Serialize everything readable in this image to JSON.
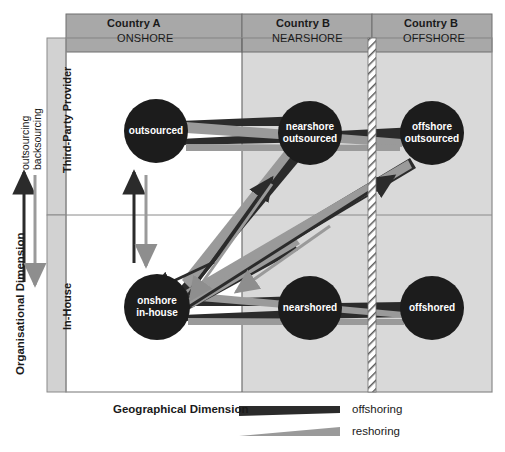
{
  "figure": {
    "type": "diagram"
  },
  "columns": [
    {
      "id": "onshore",
      "country": "Country A",
      "shore": "ONSHORE",
      "shaded": false
    },
    {
      "id": "nearshore",
      "country": "Country B",
      "shore": "NEARSHORE",
      "shaded": true
    },
    {
      "id": "offshore",
      "country": "Country B",
      "shore": "OFFSHORE",
      "shaded": true
    }
  ],
  "rows": [
    {
      "id": "third-party",
      "label": "Third-Party Provider"
    },
    {
      "id": "in-house",
      "label": "In-House"
    }
  ],
  "axes": {
    "vertical": {
      "label": "Organisational Dimension",
      "up_arrow_label": "outsourcing",
      "down_arrow_label": "backsourcing"
    },
    "horizontal": {
      "label": "Geographical Dimension"
    }
  },
  "nodes": [
    {
      "id": "outsourced",
      "label": "outsourced",
      "row": "third-party",
      "col": "onshore",
      "cx": 156,
      "cy": 131,
      "r": 32
    },
    {
      "id": "nearshore-outsourced",
      "label": "nearshore\noutsourced",
      "row": "third-party",
      "col": "nearshore",
      "cx": 310,
      "cy": 133,
      "r": 32
    },
    {
      "id": "offshore-outsourced",
      "label": "offshore\noutsourced",
      "row": "third-party",
      "col": "offshore",
      "cx": 432,
      "cy": 133,
      "r": 32
    },
    {
      "id": "onshore-in-house",
      "label": "onshore\nin-house",
      "row": "in-house",
      "col": "onshore",
      "cx": 157,
      "cy": 307,
      "r": 33
    },
    {
      "id": "nearshored",
      "label": "nearshored",
      "row": "in-house",
      "col": "nearshore",
      "cx": 310,
      "cy": 308,
      "r": 32
    },
    {
      "id": "offshored",
      "label": "offshored",
      "row": "in-house",
      "col": "offshore",
      "cx": 432,
      "cy": 308,
      "r": 32
    }
  ],
  "legend": [
    {
      "id": "offshoring",
      "label": "offshoring",
      "color": "#2b2b2b",
      "shape": "tapered-wedge-dark"
    },
    {
      "id": "reshoring",
      "label": "reshoring",
      "color": "#8e8e8e",
      "shape": "tapered-wedge-grey"
    }
  ],
  "colors": {
    "offshoring": "#2b2b2b",
    "reshoring": "#8e8e8e",
    "header_fill": "#a8a8a8",
    "rowlabel_fill": "#d2d2d2",
    "shaded_cell": "#d9d9d9",
    "plain_cell": "#ffffff",
    "frame_line": "#8a8a8a",
    "node_fill": "#1c1c1c",
    "node_text": "#ffffff"
  },
  "flows": {
    "offshoring_note": "dark tapered wedges widen toward the offshore/destination end",
    "reshoring_note": "grey tapered wedges widen toward the onshore/home end"
  }
}
